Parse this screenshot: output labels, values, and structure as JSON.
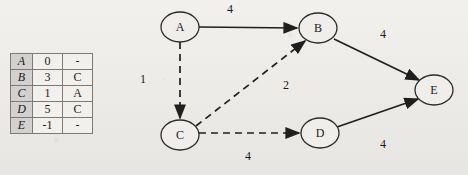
{
  "table": {
    "columns": [
      "node",
      "distance",
      "predecessor"
    ],
    "rows": [
      {
        "node": "A",
        "distance": "0",
        "predecessor": "-"
      },
      {
        "node": "B",
        "distance": "3",
        "predecessor": "C"
      },
      {
        "node": "C",
        "distance": "1",
        "predecessor": "A"
      },
      {
        "node": "D",
        "distance": "5",
        "predecessor": "C"
      },
      {
        "node": "E",
        "distance": "-1",
        "predecessor": "-"
      }
    ]
  },
  "graph": {
    "nodes": [
      {
        "id": "A",
        "label": "A",
        "cx": 180,
        "cy": 27,
        "rx": 19,
        "ry": 15
      },
      {
        "id": "B",
        "label": "B",
        "cx": 318,
        "cy": 28,
        "rx": 19,
        "ry": 15
      },
      {
        "id": "C",
        "label": "C",
        "cx": 180,
        "cy": 135,
        "rx": 19,
        "ry": 15
      },
      {
        "id": "D",
        "label": "D",
        "cx": 320,
        "cy": 133,
        "rx": 19,
        "ry": 15
      },
      {
        "id": "E",
        "label": "E",
        "cx": 434,
        "cy": 90,
        "rx": 19,
        "ry": 15
      }
    ],
    "edges": [
      {
        "id": "A-B",
        "from": "A",
        "to": "B",
        "weight": "4",
        "style": "solid",
        "x1": 199,
        "y1": 27,
        "x2": 297,
        "y2": 28,
        "lx": 230,
        "ly": 9
      },
      {
        "id": "A-C",
        "from": "A",
        "to": "C",
        "weight": "1",
        "style": "dashed",
        "x1": 180,
        "y1": 42,
        "x2": 180,
        "y2": 118,
        "lx": 143,
        "ly": 79
      },
      {
        "id": "C-B",
        "from": "C",
        "to": "B",
        "weight": "2",
        "style": "dashed",
        "x1": 196,
        "y1": 126,
        "x2": 305,
        "y2": 41,
        "lx": 286,
        "ly": 85
      },
      {
        "id": "C-D",
        "from": "C",
        "to": "D",
        "weight": "4",
        "style": "dashed",
        "x1": 199,
        "y1": 133,
        "x2": 299,
        "y2": 133,
        "lx": 248,
        "ly": 156
      },
      {
        "id": "B-E",
        "from": "B",
        "to": "E",
        "weight": "4",
        "style": "solid",
        "x1": 334,
        "y1": 39,
        "x2": 419,
        "y2": 80,
        "lx": 383,
        "ly": 34
      },
      {
        "id": "D-E",
        "from": "D",
        "to": "E",
        "weight": "4",
        "style": "solid",
        "x1": 337,
        "y1": 127,
        "x2": 418,
        "y2": 99,
        "lx": 383,
        "ly": 144
      }
    ]
  },
  "colors": {
    "background": "#eceae6",
    "ink": "#1f1f1f",
    "node_fill": "#f0eeea",
    "table_header_fill": "#d3d1cd"
  }
}
